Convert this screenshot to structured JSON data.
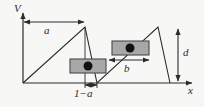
{
  "figure": {
    "type": "schematic-diagram",
    "width": 204,
    "height": 107,
    "background_color": "#f7f7f5",
    "line_color": "#2b2b2b",
    "block_fill_color": "#a8a8a8",
    "block_border_color": "#4a4a4a",
    "dot_color": "#111111"
  },
  "axes": {
    "vertical_label": "V",
    "horizontal_label": "x",
    "origin": {
      "x": 23,
      "y": 83
    },
    "vertical_top": {
      "x": 23,
      "y": 10
    },
    "horizontal_right": {
      "x": 196,
      "y": 83
    }
  },
  "waveform": {
    "shape": "sawtooth",
    "peak_height_px": 56,
    "points": [
      {
        "x": 23,
        "y": 83
      },
      {
        "x": 85,
        "y": 27
      },
      {
        "x": 97,
        "y": 83
      },
      {
        "x": 158,
        "y": 27
      },
      {
        "x": 170,
        "y": 83
      }
    ]
  },
  "dimensions": [
    {
      "id": "a",
      "label": "a",
      "orientation": "horizontal",
      "from_x": 23,
      "to_x": 85,
      "y": 22,
      "arrowheads": "both"
    },
    {
      "id": "one-minus-a",
      "label": "1−a",
      "orientation": "horizontal",
      "from_x": 85,
      "to_x": 97,
      "y": 85,
      "arrowheads": "both"
    },
    {
      "id": "b",
      "label": "b",
      "orientation": "horizontal",
      "from_x": 108,
      "to_x": 150,
      "y": 60,
      "arrowheads": "both"
    },
    {
      "id": "d",
      "label": "d",
      "orientation": "vertical",
      "x": 178,
      "from_y": 27,
      "to_y": 83,
      "arrowheads": "both"
    }
  ],
  "blocks": [
    {
      "id": "block-1",
      "x": 70,
      "y": 59,
      "width": 36,
      "height": 14,
      "dot_cx": 88,
      "dot_cy": 66,
      "dot_r": 4.5
    },
    {
      "id": "block-2",
      "x": 112,
      "y": 41,
      "width": 37,
      "height": 14,
      "dot_cx": 130,
      "dot_cy": 48,
      "dot_r": 4.5
    }
  ],
  "guide_lines": [
    {
      "id": "guide-left-block",
      "x1": 85,
      "y1": 27,
      "x2": 85,
      "y2": 87
    },
    {
      "id": "guide-right-drop",
      "x1": 85,
      "y1": 27,
      "x2": 97,
      "y2": 87
    }
  ]
}
